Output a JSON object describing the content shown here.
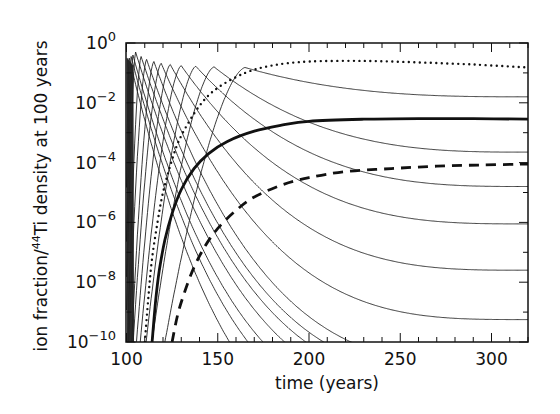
{
  "chart_data": {
    "type": "line",
    "title": "",
    "xlabel": "time (years)",
    "ylabel": "ion fraction/44Ti density at 100 years",
    "ylabel_parts": {
      "before": "ion fraction/",
      "sup": "44",
      "after": "Ti density at 100 years"
    },
    "xscale": "linear",
    "yscale": "log",
    "xlim": [
      100,
      320
    ],
    "ylim": [
      1e-10,
      1
    ],
    "x_ticks": [
      100,
      150,
      200,
      250,
      300
    ],
    "x_tick_labels": [
      "100",
      "150",
      "200",
      "250",
      "300"
    ],
    "x_minor_step": 10,
    "y_ticks_exp": [
      0,
      -2,
      -4,
      -6,
      -8,
      -10
    ],
    "y_tick_base": "10",
    "grid": false,
    "legend": null,
    "series": [
      {
        "name": "thin ionization-state curves",
        "style": "thin-solid",
        "curves": [
          {
            "t_peak": 101.5,
            "log_peak": -0.5,
            "log_end": -14,
            "rise": 0.6,
            "decay": 40
          },
          {
            "t_peak": 102.5,
            "log_peak": -0.45,
            "log_end": -13,
            "rise": 0.8,
            "decay": 38
          },
          {
            "t_peak": 103.5,
            "log_peak": -0.4,
            "log_end": -12.5,
            "rise": 1.0,
            "decay": 35
          },
          {
            "t_peak": 105,
            "log_peak": -0.3,
            "log_end": -12.0,
            "rise": 1.3,
            "decay": 30
          },
          {
            "t_peak": 108,
            "log_peak": -0.45,
            "log_end": -11.5,
            "rise": 1.8,
            "decay": 28
          },
          {
            "t_peak": 111,
            "log_peak": -0.55,
            "log_end": -11.2,
            "rise": 2.4,
            "decay": 26
          },
          {
            "t_peak": 115,
            "log_peak": -0.62,
            "log_end": -10.8,
            "rise": 3.0,
            "decay": 24
          },
          {
            "t_peak": 119,
            "log_peak": -0.68,
            "log_end": -9.25,
            "rise": 3.8,
            "decay": 22
          },
          {
            "t_peak": 124,
            "log_peak": -0.72,
            "log_end": -7.6,
            "rise": 4.6,
            "decay": 20
          },
          {
            "t_peak": 130,
            "log_peak": -0.76,
            "log_end": -6.05,
            "rise": 5.6,
            "decay": 18
          },
          {
            "t_peak": 138,
            "log_peak": -0.78,
            "log_end": -4.8,
            "rise": 6.8,
            "decay": 16
          },
          {
            "t_peak": 148,
            "log_peak": -0.8,
            "log_end": -3.65,
            "rise": 8.5,
            "decay": 14
          },
          {
            "t_peak": 165,
            "log_peak": -0.82,
            "log_end": -1.8,
            "rise": 11,
            "decay": 12
          }
        ]
      },
      {
        "name": "dotted curve",
        "style": "dotted",
        "points": [
          [
            110,
            -10
          ],
          [
            112,
            -8.5
          ],
          [
            114,
            -7.2
          ],
          [
            117,
            -6
          ],
          [
            120,
            -5
          ],
          [
            125,
            -3.9
          ],
          [
            130,
            -3.1
          ],
          [
            140,
            -2.1
          ],
          [
            150,
            -1.5
          ],
          [
            165,
            -1.0
          ],
          [
            180,
            -0.75
          ],
          [
            200,
            -0.62
          ],
          [
            230,
            -0.6
          ],
          [
            260,
            -0.65
          ],
          [
            290,
            -0.72
          ],
          [
            320,
            -0.82
          ]
        ]
      },
      {
        "name": "thick solid curve",
        "style": "thick-solid",
        "points": [
          [
            114,
            -10
          ],
          [
            116,
            -8.6
          ],
          [
            118,
            -7.6
          ],
          [
            121,
            -6.6
          ],
          [
            125,
            -5.7
          ],
          [
            130,
            -4.9
          ],
          [
            137,
            -4.2
          ],
          [
            145,
            -3.7
          ],
          [
            155,
            -3.3
          ],
          [
            170,
            -2.95
          ],
          [
            185,
            -2.75
          ],
          [
            200,
            -2.62
          ],
          [
            230,
            -2.55
          ],
          [
            260,
            -2.53
          ],
          [
            290,
            -2.53
          ],
          [
            320,
            -2.55
          ]
        ]
      },
      {
        "name": "dashed curve",
        "style": "thick-dashed",
        "points": [
          [
            125,
            -10
          ],
          [
            128,
            -9.1
          ],
          [
            132,
            -8.3
          ],
          [
            137,
            -7.5
          ],
          [
            143,
            -6.8
          ],
          [
            150,
            -6.2
          ],
          [
            160,
            -5.6
          ],
          [
            170,
            -5.15
          ],
          [
            185,
            -4.75
          ],
          [
            200,
            -4.5
          ],
          [
            220,
            -4.3
          ],
          [
            245,
            -4.2
          ],
          [
            270,
            -4.12
          ],
          [
            295,
            -4.08
          ],
          [
            320,
            -4.05
          ]
        ]
      }
    ]
  }
}
